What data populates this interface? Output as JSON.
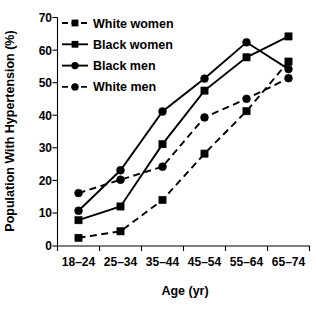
{
  "chart_data": {
    "type": "line",
    "title": "",
    "xlabel": "Age (yr)",
    "ylabel": "Population With Hypertension (%)",
    "categories": [
      "18–24",
      "25–34",
      "35–44",
      "45–54",
      "55–64",
      "65–74"
    ],
    "ylim": [
      0,
      70
    ],
    "yticks": [
      0,
      10,
      20,
      30,
      40,
      50,
      60,
      70
    ],
    "ytick_labels": [
      "0",
      "10",
      "20",
      "30",
      "40",
      "50",
      "60",
      "70"
    ],
    "grid": false,
    "legend_position": "top-left",
    "series": [
      {
        "name": "White women",
        "marker": "square",
        "line_style": "dashed",
        "color": "#000000",
        "values": [
          2.5,
          4.5,
          14.1,
          28.3,
          41.3,
          56.5
        ]
      },
      {
        "name": "Black women",
        "marker": "square",
        "line_style": "solid",
        "color": "#000000",
        "values": [
          7.9,
          12.1,
          31.2,
          47.6,
          57.8,
          64.2
        ]
      },
      {
        "name": "Black men",
        "marker": "circle",
        "line_style": "solid",
        "color": "#000000",
        "values": [
          10.8,
          23.2,
          41.2,
          51.3,
          62.4,
          54.2
        ]
      },
      {
        "name": "White men",
        "marker": "circle",
        "line_style": "dashed",
        "color": "#000000",
        "values": [
          16.2,
          20.3,
          24.3,
          39.4,
          45.1,
          51.4
        ]
      }
    ]
  }
}
